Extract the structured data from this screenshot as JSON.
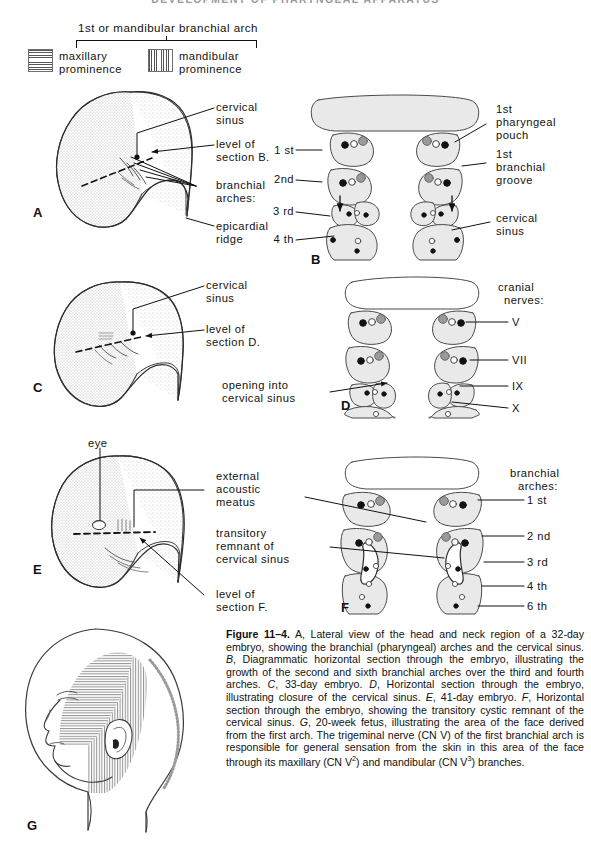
{
  "running_head": "DEVELOPMENT OF PHARYNGEAL APPARATUS",
  "legend": {
    "title": "1st or mandibular branchial arch",
    "items": [
      {
        "label_line1": "maxillary",
        "label_line2": "prominence",
        "pattern": "horizontal-lines"
      },
      {
        "label_line1": "mandibular",
        "label_line2": "prominence",
        "pattern": "vertical-lines"
      }
    ]
  },
  "panels": {
    "A": {
      "letter": "A"
    },
    "B": {
      "letter": "B"
    },
    "C": {
      "letter": "C"
    },
    "D": {
      "letter": "D"
    },
    "E": {
      "letter": "E"
    },
    "F": {
      "letter": "F"
    },
    "G": {
      "letter": "G"
    }
  },
  "labels": {
    "a_cervical_sinus_l1": "cervical",
    "a_cervical_sinus_l2": "sinus",
    "a_level_of_l1": "level of",
    "a_level_of_l2": "section B.",
    "a_branchial_l1": "branchial",
    "a_branchial_l2": "arches:",
    "a_epicardial_l1": "epicardial",
    "a_epicardial_l2": "ridge",
    "b_arch_1": "1 st",
    "b_arch_2": "2nd",
    "b_arch_3": "3 rd",
    "b_arch_4": "4 th",
    "b_pouch_l1": "1st",
    "b_pouch_l2": "pharyngeal",
    "b_pouch_l3": "pouch",
    "b_groove_l1": "1st",
    "b_groove_l2": "branchial",
    "b_groove_l3": "groove",
    "b_cervical_l1": "cervical",
    "b_cervical_l2": "sinus",
    "c_cervical_l1": "cervical",
    "c_cervical_l2": "sinus",
    "c_level_l1": "level of",
    "c_level_l2": "section D.",
    "d_opening_l1": "opening into",
    "d_opening_l2": "cervical sinus",
    "d_cranial_l1": "cranial",
    "d_cranial_l2": "nerves:",
    "d_cn_v": "V",
    "d_cn_vii": "VII",
    "d_cn_ix": "IX",
    "d_cn_x": "X",
    "e_eye": "eye",
    "e_external_l1": "external",
    "e_external_l2": "acoustic",
    "e_external_l3": "meatus",
    "e_transitory_l1": "transitory",
    "e_transitory_l2": "remnant of",
    "e_transitory_l3": "cervical sinus",
    "e_level_l1": "level of",
    "e_level_l2": "section F.",
    "f_branchial_l1": "branchial",
    "f_branchial_l2": "arches:",
    "f_arch_1": "1 st",
    "f_arch_2": "2 nd",
    "f_arch_3": "3 rd",
    "f_arch_4": "4 th",
    "f_arch_6": "6 th"
  },
  "caption": {
    "figure_number": "Figure 11–4.",
    "text": "A, Lateral view of the head and neck region of a 32-day embryo, showing the branchial (pharyngeal) arches and the cervical sinus. B, Diagrammatic horizontal section through the embryo, illustrating the growth of the second and sixth branchial arches over the third and fourth arches. C, 33-day embryo. D, Horizontal section through the embryo, illustrating closure of the cervical sinus. E, 41-day embryo. F, Horizontal section through the embryo, showing the transitory cystic remnant of the cervical sinus. G, 20-week fetus, illustrating the area of the face derived from the first arch. The trigeminal nerve (CN V) of the first branchial arch is responsible for general sensation from the skin in this area of the face through its maxillary (CN V2) and mandibular (CN V3) branches."
  },
  "colors": {
    "ink": "#111111",
    "tissue_fill": "#e9e9e9",
    "tissue_stroke": "#4a4a4a",
    "dot_dark": "#111111",
    "dot_gray": "#9a9a9a",
    "runhead": "#9a9aa2"
  }
}
